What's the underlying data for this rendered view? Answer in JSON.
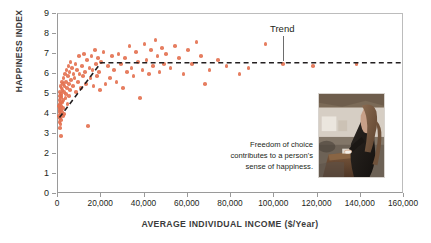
{
  "chart_data": {
    "type": "scatter",
    "title": "",
    "xlabel": "AVERAGE INDIVIDUAL INCOME ($/Year)",
    "ylabel": "HAPPINESS INDEX",
    "xlim": [
      0,
      160000
    ],
    "ylim": [
      0,
      9
    ],
    "xticks": [
      "0",
      "20,000",
      "40,000",
      "60,000",
      "80,000",
      "100,000",
      "120,000",
      "140,000",
      "160,000"
    ],
    "xtick_values": [
      0,
      20000,
      40000,
      60000,
      80000,
      100000,
      120000,
      140000,
      160000
    ],
    "yticks": [
      "0",
      "1",
      "2",
      "3",
      "4",
      "5",
      "6",
      "7",
      "8",
      "9"
    ],
    "ytick_values": [
      0,
      1,
      2,
      3,
      4,
      5,
      6,
      7,
      8,
      9
    ],
    "grid": false,
    "legend": "none",
    "point_color": "#e3704f",
    "trend_color": "#231f20",
    "series": [
      {
        "name": "Countries",
        "points": [
          [
            400,
            3.9
          ],
          [
            500,
            4.4
          ],
          [
            600,
            4.1
          ],
          [
            650,
            3.6
          ],
          [
            700,
            4.7
          ],
          [
            750,
            4.2
          ],
          [
            800,
            3.3
          ],
          [
            850,
            4.9
          ],
          [
            900,
            4.5
          ],
          [
            950,
            3.8
          ],
          [
            1000,
            5.1
          ],
          [
            1050,
            4.3
          ],
          [
            1100,
            4.0
          ],
          [
            1150,
            5.4
          ],
          [
            1200,
            3.5
          ],
          [
            1250,
            4.8
          ],
          [
            1300,
            4.6
          ],
          [
            1350,
            2.9
          ],
          [
            1400,
            5.0
          ],
          [
            1450,
            4.2
          ],
          [
            1500,
            3.7
          ],
          [
            1550,
            5.3
          ],
          [
            1600,
            4.4
          ],
          [
            1700,
            4.9
          ],
          [
            1800,
            5.6
          ],
          [
            1900,
            4.1
          ],
          [
            2000,
            5.2
          ],
          [
            2100,
            4.6
          ],
          [
            2200,
            3.9
          ],
          [
            2300,
            5.5
          ],
          [
            2400,
            4.3
          ],
          [
            2500,
            5.8
          ],
          [
            2600,
            4.7
          ],
          [
            2700,
            5.1
          ],
          [
            2800,
            4.0
          ],
          [
            3000,
            5.4
          ],
          [
            3200,
            6.0
          ],
          [
            3400,
            4.8
          ],
          [
            3600,
            5.6
          ],
          [
            3800,
            5.0
          ],
          [
            4000,
            6.2
          ],
          [
            4200,
            5.3
          ],
          [
            4400,
            4.5
          ],
          [
            4600,
            5.9
          ],
          [
            4800,
            6.4
          ],
          [
            5000,
            5.5
          ],
          [
            5200,
            4.9
          ],
          [
            5400,
            6.1
          ],
          [
            5600,
            5.2
          ],
          [
            5800,
            6.6
          ],
          [
            6000,
            5.7
          ],
          [
            6400,
            6.3
          ],
          [
            6800,
            5.4
          ],
          [
            7200,
            6.0
          ],
          [
            7600,
            5.8
          ],
          [
            8000,
            6.5
          ],
          [
            8400,
            5.1
          ],
          [
            8800,
            6.2
          ],
          [
            9200,
            5.6
          ],
          [
            9600,
            6.9
          ],
          [
            10000,
            6.0
          ],
          [
            10500,
            5.3
          ],
          [
            11000,
            6.4
          ],
          [
            11500,
            5.9
          ],
          [
            12000,
            7.0
          ],
          [
            12500,
            6.1
          ],
          [
            13000,
            5.5
          ],
          [
            13500,
            6.7
          ],
          [
            14000,
            3.4
          ],
          [
            14500,
            6.3
          ],
          [
            15000,
            5.8
          ],
          [
            15500,
            6.9
          ],
          [
            16000,
            6.2
          ],
          [
            16500,
            5.4
          ],
          [
            17000,
            7.2
          ],
          [
            17500,
            6.5
          ],
          [
            18000,
            5.9
          ],
          [
            18500,
            6.8
          ],
          [
            19000,
            6.1
          ],
          [
            19500,
            5.2
          ],
          [
            20000,
            6.6
          ],
          [
            21000,
            7.1
          ],
          [
            22000,
            5.5
          ],
          [
            23000,
            6.4
          ],
          [
            24000,
            5.8
          ],
          [
            25000,
            6.9
          ],
          [
            26000,
            6.2
          ],
          [
            27000,
            5.6
          ],
          [
            28000,
            7.0
          ],
          [
            29000,
            6.5
          ],
          [
            30000,
            5.3
          ],
          [
            31000,
            6.8
          ],
          [
            32000,
            6.1
          ],
          [
            33000,
            7.4
          ],
          [
            34000,
            6.3
          ],
          [
            35000,
            5.9
          ],
          [
            36000,
            7.1
          ],
          [
            37000,
            6.6
          ],
          [
            38000,
            4.8
          ],
          [
            39000,
            6.2
          ],
          [
            40000,
            7.5
          ],
          [
            41000,
            6.7
          ],
          [
            42000,
            6.0
          ],
          [
            43000,
            7.2
          ],
          [
            44000,
            6.4
          ],
          [
            45000,
            7.7
          ],
          [
            46000,
            6.9
          ],
          [
            47000,
            6.1
          ],
          [
            48000,
            7.3
          ],
          [
            49000,
            6.5
          ],
          [
            50000,
            7.0
          ],
          [
            52000,
            6.3
          ],
          [
            54000,
            7.4
          ],
          [
            56000,
            6.8
          ],
          [
            58000,
            6.0
          ],
          [
            60000,
            7.2
          ],
          [
            62000,
            6.5
          ],
          [
            64000,
            7.6
          ],
          [
            66000,
            6.9
          ],
          [
            68000,
            5.5
          ],
          [
            70000,
            6.2
          ],
          [
            74000,
            6.7
          ],
          [
            78000,
            6.4
          ],
          [
            84000,
            6.0
          ],
          [
            88000,
            6.3
          ],
          [
            96000,
            7.5
          ],
          [
            104000,
            6.5
          ],
          [
            118000,
            6.4
          ],
          [
            138000,
            6.5
          ]
        ]
      }
    ],
    "trend_line": {
      "label": "Trend",
      "style": "dashed",
      "points": [
        [
          700,
          3.8
        ],
        [
          20000,
          6.55
        ],
        [
          160000,
          6.55
        ]
      ]
    }
  },
  "annotations": {
    "trend_label": "Trend",
    "caption": "Freedom of choice contributes to a person's sense of happiness.",
    "photo_alt": "woman-casting-ballot-photo"
  }
}
